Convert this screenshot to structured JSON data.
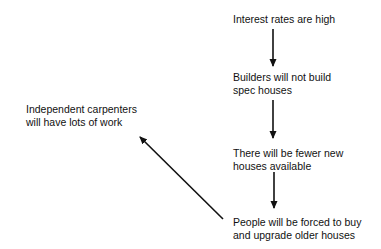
{
  "diagram": {
    "type": "causal-chain",
    "nodes": [
      {
        "id": "interest_rates",
        "lines": [
          "Interest rates are high"
        ]
      },
      {
        "id": "builders",
        "lines": [
          "Builders will not build",
          "spec houses"
        ]
      },
      {
        "id": "fewer_houses",
        "lines": [
          "There will be fewer new",
          "houses available"
        ]
      },
      {
        "id": "people_forced",
        "lines": [
          "People will be forced to buy",
          "and upgrade older houses"
        ]
      },
      {
        "id": "carpenters",
        "lines": [
          "Independent carpenters",
          "will have lots of work"
        ]
      }
    ],
    "edges": [
      {
        "from": "interest_rates",
        "to": "builders"
      },
      {
        "from": "builders",
        "to": "fewer_houses"
      },
      {
        "from": "fewer_houses",
        "to": "people_forced"
      },
      {
        "from": "people_forced",
        "to": "carpenters"
      }
    ],
    "colors": {
      "text": "#111111",
      "arrow": "#111111",
      "background": "#ffffff"
    }
  }
}
